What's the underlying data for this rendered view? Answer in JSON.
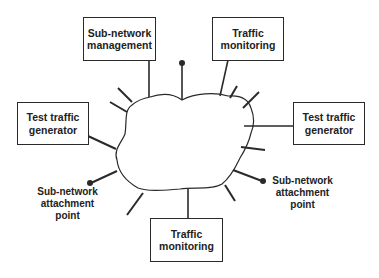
{
  "diagram": {
    "center": {
      "label": "",
      "shape": "cloud"
    },
    "boxes": {
      "sub_network_management": {
        "line1": "Sub-network",
        "line2": "management"
      },
      "traffic_monitoring_top": {
        "line1": "Traffic",
        "line2": "monitoring"
      },
      "test_traffic_generator_left": {
        "line1": "Test traffic",
        "line2": "generator"
      },
      "test_traffic_generator_right": {
        "line1": "Test traffic",
        "line2": "generator"
      },
      "traffic_monitoring_bottom": {
        "line1": "Traffic",
        "line2": "monitoring"
      }
    },
    "attachment_labels": {
      "left": {
        "line1": "Sub-network",
        "line2": "attachment",
        "line3": "point"
      },
      "right": {
        "line1": "Sub-network",
        "line2": "attachment",
        "line3": "point"
      }
    },
    "colors": {
      "stroke": "#2a2a2a",
      "text": "#222222",
      "background": "#ffffff"
    }
  }
}
